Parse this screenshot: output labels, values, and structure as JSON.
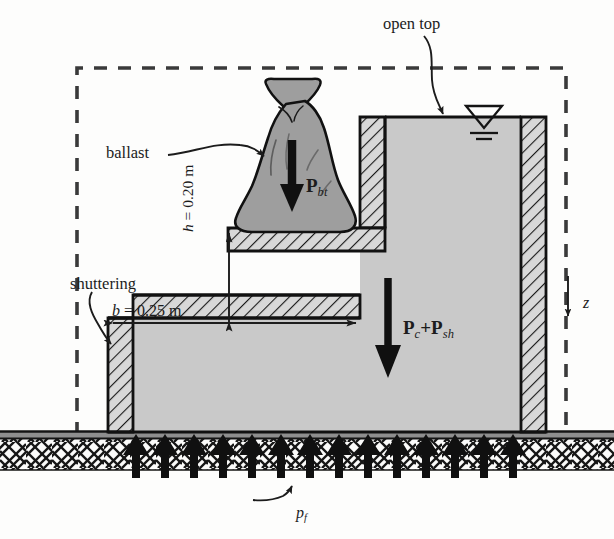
{
  "figure": {
    "domain": "engineering-diagram"
  },
  "colors": {
    "concrete_fill": "#c9c9c9",
    "ballast_fill": "#9e9e9e",
    "shutter_hatch_bg": "#d4d4d4",
    "ground_bg": "#f2f2f0",
    "ink": "#1c1c1c",
    "dashed_boundary": "#3a3a3a",
    "arrow_black": "#101010"
  },
  "labels": {
    "open_top": "open top",
    "ballast": "ballast",
    "shuttering": "shuttering",
    "width_dim": "b = 0.25 m",
    "width_dim_symbol": "b",
    "width_dim_value": "= 0.25 m",
    "height_dim": "h = 0.20 m",
    "height_dim_symbol": "h",
    "height_dim_value": "= 0.20 m",
    "ballast_force_symbol": "P",
    "ballast_force_subscript": "bt",
    "concrete_force_symbol_1": "P",
    "concrete_force_subscript_1": "c",
    "concrete_force_plus": "+",
    "concrete_force_symbol_2": "P",
    "concrete_force_subscript_2": "sh",
    "depth_axis": "z",
    "foundation_pressure_symbol": "p",
    "foundation_pressure_subscript": "f"
  },
  "dimensions": {
    "b_value": 0.25,
    "b_unit": "m",
    "h_value": 0.2,
    "h_unit": "m"
  },
  "forces": [
    {
      "name": "ballast-weight",
      "label": "P_bt",
      "direction": "down"
    },
    {
      "name": "concrete-and-shuttering-weight",
      "label": "P_c+P_sh",
      "direction": "down"
    },
    {
      "name": "foundation-pressure",
      "label": "p_f",
      "direction": "up",
      "arrow_count": 14
    }
  ],
  "annotations": {
    "water_table_symbol": "water-table-triangle",
    "open_top_leader": "curved-arrow",
    "ballast_leader": "curved-arrow",
    "shuttering_leader": "curved-arrow",
    "pf_leader": "curved-arrow"
  },
  "geometry": {
    "dashed_boundary": {
      "x": 77,
      "y": 68,
      "width": 489,
      "height": 367
    },
    "ground_line_y": 435,
    "step_ledge_y": 228,
    "step_corner_x": 360,
    "lower_left_x": 108,
    "lower_step_y": 318,
    "outer_right_x": 546,
    "top_wall_y": 117
  }
}
